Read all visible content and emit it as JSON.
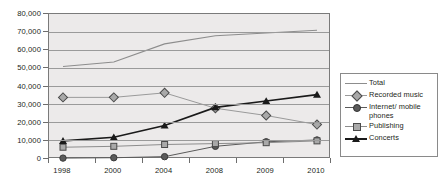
{
  "chart_data": {
    "type": "line",
    "title": "",
    "xlabel": "",
    "ylabel": "",
    "categories": [
      "1998",
      "2000",
      "2004",
      "2008",
      "2009",
      "2010"
    ],
    "ylim": [
      0,
      80000
    ],
    "yticks": [
      0,
      10000,
      20000,
      30000,
      40000,
      50000,
      60000,
      70000,
      80000
    ],
    "ytick_labels": [
      "0",
      "10,000",
      "20,000",
      "30,000",
      "40,000",
      "50,000",
      "60,000",
      "70,000",
      "80,000"
    ],
    "grid": true,
    "legend_position": "right",
    "series": [
      {
        "name": "Total",
        "marker": "none",
        "color": "#8d8d8d",
        "values": [
          51000,
          53500,
          63500,
          68000,
          69500,
          71000
        ]
      },
      {
        "name": "Recorded music",
        "marker": "diamond",
        "color": "#9a9a9a",
        "values": [
          34000,
          34000,
          36500,
          28000,
          24000,
          19000
        ]
      },
      {
        "name": "Internet/mobile phones",
        "marker": "circle",
        "color": "#5a5a5a",
        "values": [
          500,
          700,
          1300,
          7000,
          9500,
          10500
        ]
      },
      {
        "name": "Publishing",
        "marker": "square",
        "color": "#8d8d8d",
        "values": [
          6500,
          7000,
          8000,
          8500,
          9000,
          10000
        ]
      },
      {
        "name": "Concerts",
        "marker": "triangle",
        "color": "#1a1a1a",
        "values": [
          10000,
          12000,
          18500,
          28500,
          32000,
          35500
        ]
      }
    ]
  },
  "legend": {
    "entries": [
      {
        "label": "Total",
        "key": "line-swatch"
      },
      {
        "label": "Recorded music",
        "key": "diamond-marker-icon"
      },
      {
        "label": "Internet/ mobile phones",
        "key": "circle-marker-icon"
      },
      {
        "label": "Publishing",
        "key": "square-marker-icon"
      },
      {
        "label": "Concerts",
        "key": "triangle-marker-icon"
      }
    ]
  }
}
